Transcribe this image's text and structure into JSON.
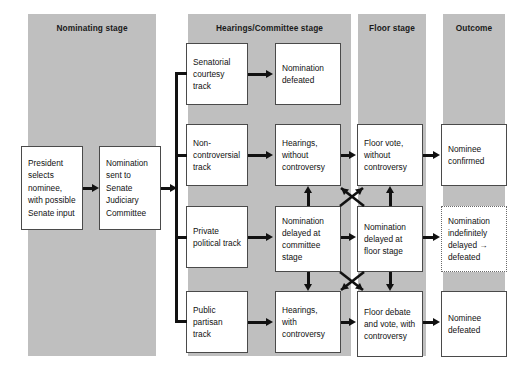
{
  "diagram": {
    "colors": {
      "band": "#bfbfbf",
      "box_border": "#4a4a4a",
      "connector": "#111111",
      "background": "#ffffff"
    },
    "columns": [
      {
        "label": "Nominating stage"
      },
      {
        "label": "Hearings/Committee stage"
      },
      {
        "label": "Floor stage"
      },
      {
        "label": "Outcome"
      }
    ],
    "boxes": {
      "president": "President selects nominee, with possible Senate input",
      "judiciary": "Nomination sent to Senate Judiciary Committee",
      "track_senatorial": "Senatorial courtesy track",
      "track_noncontroversial": "Non-controversial track",
      "track_private": "Private political track",
      "track_public": "Public partisan track",
      "nomination_defeated": "Nomination defeated",
      "hearings_without": "Hearings, without controversy",
      "delayed_committee": "Nomination delayed at committee stage",
      "hearings_with": "Hearings, with controversy",
      "floor_vote_without": "Floor vote, without controversy",
      "delayed_floor": "Nomination delayed at floor stage",
      "floor_debate_with": "Floor debate and vote, with controversy",
      "nominee_confirmed": "Nominee confirmed",
      "indefinitely_delayed": "Nomination indefinitely delayed → defeated",
      "nominee_defeated": "Nominee defeated"
    }
  }
}
